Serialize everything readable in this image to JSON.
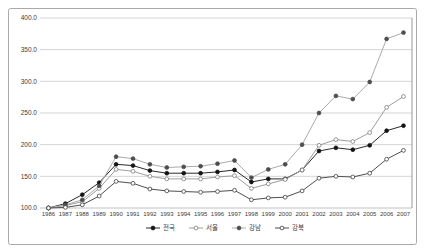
{
  "window": {
    "background": "#ffffff",
    "frame_border_color": "#a9a9a9"
  },
  "colors": {
    "gridline": "#c9c9c9",
    "plot_bottom_line": "#b3b3b3",
    "plot_right_border": "#8c8c8c",
    "tick_text": "#3c3c3c",
    "legend_text": "#3c3c3c"
  },
  "chart_data": {
    "type": "line",
    "title": "",
    "xlabel": "",
    "ylabel": "",
    "x": [
      1986,
      1987,
      1988,
      1989,
      1990,
      1991,
      1992,
      1993,
      1994,
      1995,
      1996,
      1997,
      1998,
      1999,
      2000,
      2001,
      2002,
      2003,
      2004,
      2005,
      2006,
      2007
    ],
    "ylim": [
      100,
      400
    ],
    "ytick_step": 50,
    "ytick_labels": [
      "100.0",
      "150.0",
      "200.0",
      "250.0",
      "300.0",
      "350.0",
      "400.0"
    ],
    "grid": true,
    "legend_position": "bottom-center",
    "series": [
      {
        "id": "nationwide",
        "name": "전국",
        "marker": "filled-circle",
        "line_color": "#2a2a2a",
        "marker_fill": "#141414",
        "marker_stroke": "#141414",
        "values": [
          100,
          107,
          121,
          140,
          169,
          167,
          159,
          155,
          155,
          155,
          157,
          160,
          141,
          146,
          146,
          160,
          190,
          195,
          192,
          199,
          222,
          230
        ]
      },
      {
        "id": "seoul",
        "name": "서울",
        "marker": "open-circle",
        "line_color": "#9d9d9d",
        "marker_fill": "#ffffff",
        "marker_stroke": "#7d7d7d",
        "values": [
          100,
          104,
          110,
          131,
          161,
          158,
          150,
          146,
          146,
          146,
          149,
          151,
          131,
          138,
          145,
          160,
          199,
          208,
          205,
          219,
          259,
          276
        ]
      },
      {
        "id": "gangnam",
        "name": "강남",
        "marker": "filled-circle",
        "line_color": "#ababab",
        "marker_fill": "#4d4d4d",
        "marker_stroke": "#4d4d4d",
        "values": [
          100,
          105,
          113,
          135,
          181,
          178,
          169,
          164,
          165,
          166,
          170,
          175,
          148,
          161,
          169,
          200,
          250,
          277,
          272,
          299,
          367,
          377
        ]
      },
      {
        "id": "gangbuk",
        "name": "강북",
        "marker": "open-circle",
        "line_color": "#4f4f4f",
        "marker_fill": "#ffffff",
        "marker_stroke": "#3f3f3f",
        "values": [
          100,
          101,
          105,
          119,
          142,
          139,
          130,
          127,
          126,
          125,
          126,
          128,
          113,
          116,
          117,
          127,
          147,
          150,
          149,
          155,
          177,
          191
        ]
      }
    ]
  }
}
